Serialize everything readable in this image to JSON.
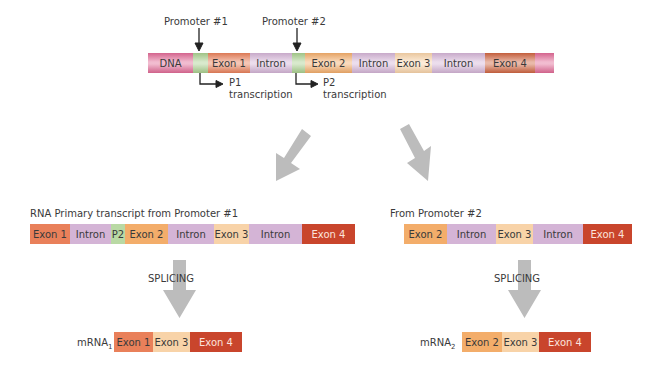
{
  "colors": {
    "dna": "#e16a96",
    "promoter": "#a9cf8e",
    "exon1": "#e9805a",
    "intron": "#d4b4d6",
    "exon2": "#f3ad6a",
    "exon3": "#f8d3a8",
    "exon4": "#c9452c",
    "arrow_gray": "#bcbcbc"
  },
  "dna": {
    "promoter1_label": "Promoter #1",
    "promoter2_label": "Promoter #2",
    "p1_label": "P1",
    "p1_sub": "transcription",
    "p2_label": "P2",
    "p2_sub": "transcription",
    "segments": [
      {
        "label": "DNA",
        "type": "dna",
        "width": 45
      },
      {
        "label": "",
        "type": "promoter",
        "width": 15
      },
      {
        "label": "Exon 1",
        "type": "exon1",
        "width": 42
      },
      {
        "label": "Intron",
        "type": "intron",
        "width": 42
      },
      {
        "label": "",
        "type": "promoter",
        "width": 13
      },
      {
        "label": "Exon 2",
        "type": "exon2",
        "width": 47
      },
      {
        "label": "Intron",
        "type": "intron",
        "width": 43
      },
      {
        "label": "Exon 3",
        "type": "exon3",
        "width": 37
      },
      {
        "label": "Intron",
        "type": "intron",
        "width": 53
      },
      {
        "label": "Exon 4",
        "type": "exon4",
        "width": 50
      },
      {
        "label": "",
        "type": "dna",
        "width": 19
      }
    ]
  },
  "transcript1": {
    "title": "RNA Primary transcript from Promoter #1",
    "segments": [
      {
        "label": "Exon 1",
        "type": "exon1",
        "width": 40
      },
      {
        "label": "Intron",
        "type": "intron",
        "width": 41
      },
      {
        "label": "P2",
        "type": "promoter",
        "width": 14
      },
      {
        "label": "Exon 2",
        "type": "exon2",
        "width": 43
      },
      {
        "label": "Intron",
        "type": "intron",
        "width": 46
      },
      {
        "label": "Exon 3",
        "type": "exon3",
        "width": 35
      },
      {
        "label": "Intron",
        "type": "intron",
        "width": 53
      },
      {
        "label": "Exon 4",
        "type": "exon4",
        "width": 53
      }
    ],
    "splicing_label": "SPLICING"
  },
  "transcript2": {
    "title": "From Promoter #2",
    "segments": [
      {
        "label": "Exon 2",
        "type": "exon2",
        "width": 43
      },
      {
        "label": "Intron",
        "type": "intron",
        "width": 49
      },
      {
        "label": "Exon 3",
        "type": "exon3",
        "width": 37
      },
      {
        "label": "Intron",
        "type": "intron",
        "width": 50
      },
      {
        "label": "Exon 4",
        "type": "exon4",
        "width": 49
      }
    ],
    "splicing_label": "SPLICING"
  },
  "mrna1": {
    "label": "mRNA",
    "subscript": "1",
    "segments": [
      {
        "label": "Exon 1",
        "type": "exon1",
        "width": 39
      },
      {
        "label": "Exon 3",
        "type": "exon3",
        "width": 37
      },
      {
        "label": "Exon 4",
        "type": "exon4",
        "width": 52
      }
    ]
  },
  "mrna2": {
    "label": "mRNA",
    "subscript": "2",
    "segments": [
      {
        "label": "Exon 2",
        "type": "exon2",
        "width": 40
      },
      {
        "label": "Exon 3",
        "type": "exon3",
        "width": 37
      },
      {
        "label": "Exon 4",
        "type": "exon4",
        "width": 52
      }
    ]
  }
}
